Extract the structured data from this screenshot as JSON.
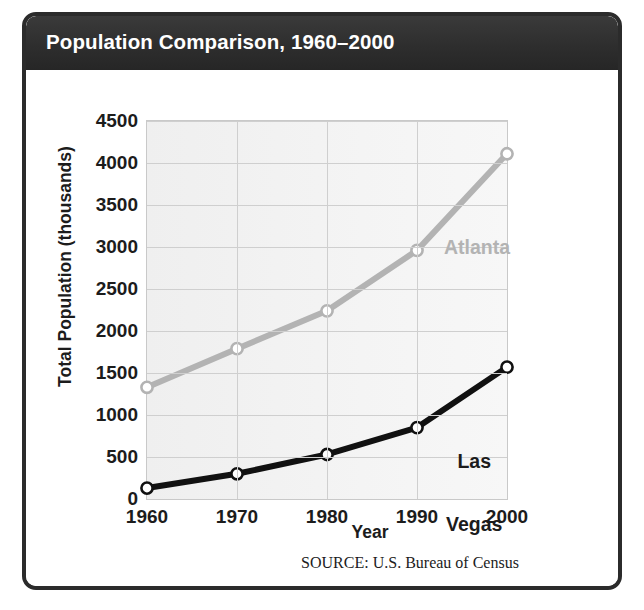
{
  "figure": {
    "title": "Population Comparison, 1960–2000",
    "source": "SOURCE: U.S. Bureau of Census",
    "frame_color": "#2b2b2b",
    "header_color": "#333333",
    "plot_background": "#f2f2f2"
  },
  "chart_data": {
    "type": "line",
    "title": "Population Comparison, 1960–2000",
    "xlabel": "Year",
    "ylabel": "Total Population (thousands)",
    "x": [
      1960,
      1970,
      1980,
      1990,
      2000
    ],
    "xtick_labels": [
      "1960",
      "1970",
      "1980",
      "1990",
      "2000"
    ],
    "ytick_labels": [
      "0",
      "500",
      "1000",
      "1500",
      "2000",
      "2500",
      "3000",
      "3500",
      "4000",
      "4500"
    ],
    "yticks": [
      0,
      500,
      1000,
      1500,
      2000,
      2500,
      3000,
      3500,
      4000,
      4500
    ],
    "ylim": [
      0,
      4500
    ],
    "xlim": [
      1960,
      2000
    ],
    "grid": true,
    "legend_position": "inline-annotations",
    "series": [
      {
        "name": "Atlanta",
        "color": "#b3b3b3",
        "marker": "open-circle",
        "values": [
          1330,
          1790,
          2240,
          2960,
          4110
        ],
        "label_text": "Atlanta"
      },
      {
        "name": "Las Vegas",
        "color": "#111111",
        "marker": "open-circle",
        "values": [
          130,
          300,
          530,
          850,
          1570
        ],
        "label_text": "Las\nVegas",
        "label_line1": "Las",
        "label_line2": "Vegas"
      }
    ],
    "source": "SOURCE: U.S. Bureau of Census"
  }
}
